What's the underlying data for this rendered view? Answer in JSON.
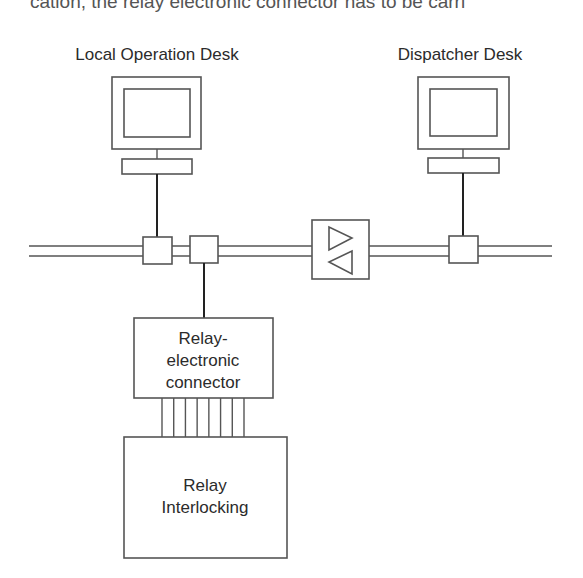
{
  "page": {
    "clipped_text_top": "cation, the relay electronic connector has to be carri"
  },
  "diagram": {
    "nodes": {
      "local_desk": {
        "label": "Local Operation Desk",
        "type": "workstation"
      },
      "dispatcher_desk": {
        "label": "Dispatcher Desk",
        "type": "workstation"
      },
      "amplifier": {
        "label": "",
        "type": "bidirectional-repeater"
      },
      "relay_connector": {
        "label_lines": [
          "Relay-",
          "electronic",
          "connector"
        ],
        "type": "box"
      },
      "relay_interlocking": {
        "label_lines": [
          "Relay",
          "Interlocking"
        ],
        "type": "box"
      }
    },
    "bus": {
      "type": "double-line-network",
      "taps": [
        "local-desk-tap",
        "relay-connector-tap",
        "dispatcher-desk-tap"
      ]
    },
    "parallel_wire_count": 8,
    "colors": {
      "line": "#555555",
      "text": "#2b2b2b",
      "background": "#ffffff"
    }
  }
}
